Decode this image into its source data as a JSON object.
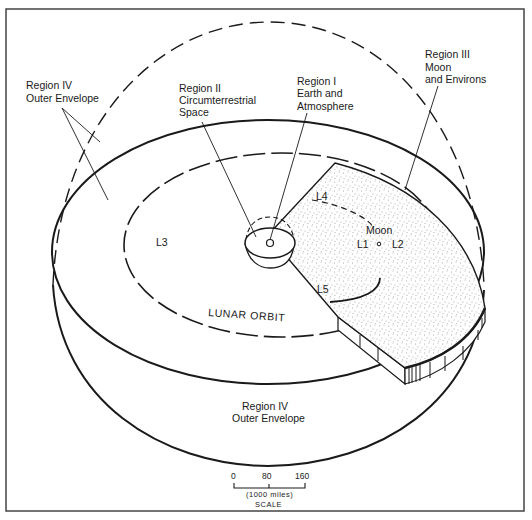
{
  "diagram": {
    "labels": {
      "region_iv_top": [
        "Region IV",
        "Outer Envelope"
      ],
      "region_ii": [
        "Region II",
        "Circumterrestrial",
        "Space"
      ],
      "region_i": [
        "Region I",
        "Earth and",
        "Atmosphere"
      ],
      "region_iii": [
        "Region III",
        "Moon",
        "and Environs"
      ],
      "region_iv_bottom": [
        "Region IV",
        "Outer Envelope"
      ],
      "lagrange": {
        "l1": "L1",
        "l2": "L2",
        "l3": "L3",
        "l4": "L4",
        "l5": "L5"
      },
      "moon": "Moon",
      "lunar_orbit": "LUNAR ORBIT"
    },
    "scale": {
      "ticks": [
        "0",
        "80",
        "160"
      ],
      "unit": "(1000 miles)",
      "title": "SCALE"
    },
    "colors": {
      "line": "#1a1a1a",
      "background": "#ffffff",
      "stipple": "#555555"
    }
  }
}
